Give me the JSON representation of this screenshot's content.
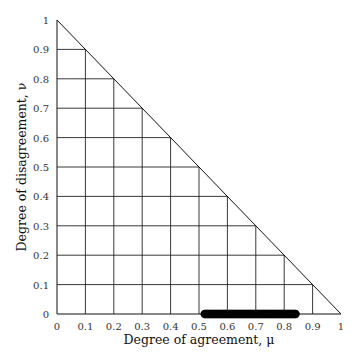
{
  "chart_data": {
    "type": "scatter",
    "title": "",
    "xlabel": "Degree of agreement, μ",
    "ylabel": "Degree of disagreement, ν",
    "xlim": [
      0,
      1
    ],
    "ylim": [
      0,
      1
    ],
    "xticks": [
      "0",
      "0.1",
      "0.2",
      "0.3",
      "0.4",
      "0.5",
      "0.6",
      "0.7",
      "0.8",
      "0.9",
      "1"
    ],
    "yticks": [
      "0",
      "0.1",
      "0.2",
      "0.3",
      "0.4",
      "0.5",
      "0.6",
      "0.7",
      "0.8",
      "0.9",
      "1"
    ],
    "grid": "triangular grid below line μ + ν = 1",
    "boundary_line": {
      "from": [
        0,
        1
      ],
      "to": [
        1,
        0
      ]
    },
    "series": [
      {
        "name": "points",
        "marker": "filled circle",
        "color": "#000000",
        "points_range": {
          "mu_from": 0.52,
          "mu_to": 0.84,
          "nu": 0
        },
        "x": [
          0.52,
          0.54,
          0.56,
          0.58,
          0.6,
          0.62,
          0.64,
          0.66,
          0.68,
          0.7,
          0.72,
          0.74,
          0.76,
          0.78,
          0.8,
          0.82,
          0.84
        ],
        "y": [
          0,
          0,
          0,
          0,
          0,
          0,
          0,
          0,
          0,
          0,
          0,
          0,
          0,
          0,
          0,
          0,
          0
        ]
      }
    ]
  }
}
